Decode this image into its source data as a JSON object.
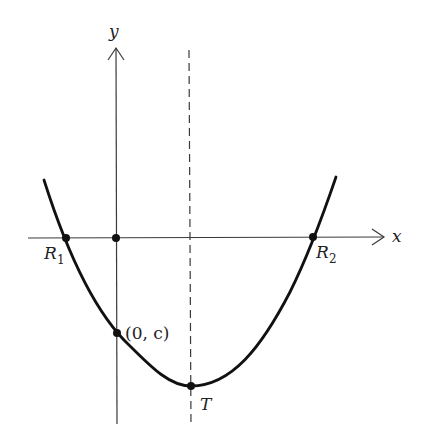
{
  "figure": {
    "type": "parabola-diagram",
    "colors": {
      "curve": "#111111",
      "axes": "#3a3a3a",
      "background": "#ffffff"
    }
  },
  "axes": {
    "x_label": "x",
    "y_label": "y"
  },
  "points": {
    "r1": {
      "letter": "R",
      "subscript": "1"
    },
    "r2": {
      "letter": "R",
      "subscript": "2"
    },
    "y_intercept": {
      "label": "(0, c)"
    },
    "vertex": {
      "label": "T"
    },
    "origin": {
      "label": ""
    }
  },
  "lines": {
    "axis_of_symmetry": {
      "style": "dashed"
    }
  }
}
